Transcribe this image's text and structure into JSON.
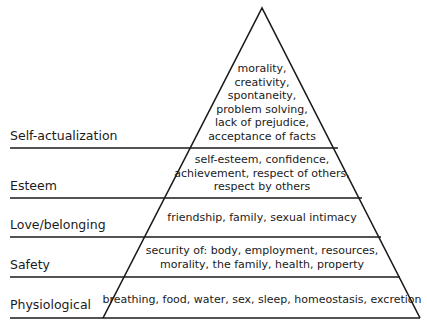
{
  "levels": [
    {
      "label": "Self-actualization",
      "needs": [
        "morality,",
        "creativity,",
        "spontaneity,",
        "problem solving,",
        "lack of prejudice,",
        "acceptance of facts"
      ]
    },
    {
      "label": "Esteem",
      "needs": [
        "self-esteem, confidence,",
        "achievement, respect of others,",
        "respect by others"
      ]
    },
    {
      "label": "Love/belonging",
      "needs": [
        "friendship, family, sexual intimacy"
      ]
    },
    {
      "label": "Safety",
      "needs": [
        "security of: body, employment, resources,",
        "morality, the family, health, property"
      ]
    },
    {
      "label": "Physiological",
      "needs": [
        "breathing, food, water, sex, sleep, homeostasis, excretion"
      ]
    }
  ],
  "colors": {
    "line": "#1a1a1a",
    "background": "#ffffff"
  }
}
